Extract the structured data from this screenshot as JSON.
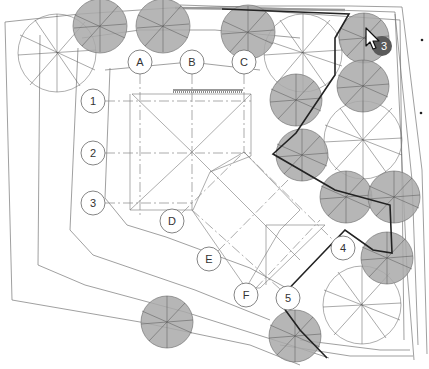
{
  "drawing": {
    "type": "site-plan",
    "grid_columns": [
      {
        "id": "col-a",
        "label": "A",
        "x": 140,
        "y": 62
      },
      {
        "id": "col-b",
        "label": "B",
        "x": 192,
        "y": 62
      },
      {
        "id": "col-c",
        "label": "C",
        "x": 244,
        "y": 62
      },
      {
        "id": "col-d",
        "label": "D",
        "x": 172,
        "y": 221
      },
      {
        "id": "col-e",
        "label": "E",
        "x": 209,
        "y": 259
      },
      {
        "id": "col-f",
        "label": "F",
        "x": 246,
        "y": 295
      }
    ],
    "grid_rows": [
      {
        "id": "row-1",
        "label": "1",
        "x": 93,
        "y": 101
      },
      {
        "id": "row-2",
        "label": "2",
        "x": 93,
        "y": 153
      },
      {
        "id": "row-3",
        "label": "3",
        "x": 93,
        "y": 203
      },
      {
        "id": "row-4",
        "label": "4",
        "x": 343,
        "y": 248
      },
      {
        "id": "row-5",
        "label": "5",
        "x": 288,
        "y": 298
      }
    ],
    "filled_trees": [
      {
        "cx": 100,
        "cy": 26,
        "r": 27
      },
      {
        "cx": 163,
        "cy": 26,
        "r": 27
      },
      {
        "cx": 248,
        "cy": 32,
        "r": 27
      },
      {
        "cx": 364,
        "cy": 38,
        "r": 25
      },
      {
        "cx": 296,
        "cy": 100,
        "r": 26
      },
      {
        "cx": 363,
        "cy": 86,
        "r": 26
      },
      {
        "cx": 302,
        "cy": 155,
        "r": 26
      },
      {
        "cx": 346,
        "cy": 197,
        "r": 26
      },
      {
        "cx": 394,
        "cy": 197,
        "r": 26
      },
      {
        "cx": 387,
        "cy": 258,
        "r": 26
      },
      {
        "cx": 295,
        "cy": 336,
        "r": 26
      },
      {
        "cx": 167,
        "cy": 322,
        "r": 26
      }
    ],
    "open_trees": [
      {
        "cx": 57,
        "cy": 53,
        "r": 39
      },
      {
        "cx": 303,
        "cy": 53,
        "r": 39
      },
      {
        "cx": 363,
        "cy": 140,
        "r": 39
      },
      {
        "cx": 362,
        "cy": 305,
        "r": 39
      }
    ],
    "cursor": {
      "x": 366,
      "y": 28,
      "badge_label": "3",
      "badge_color": "#5a5a5a"
    },
    "margin_marks": [
      {
        "x": 422,
        "y": 40
      },
      {
        "x": 421,
        "y": 113
      }
    ],
    "colors": {
      "tree_fill": "#a9a9a9",
      "line": "#777777",
      "heavy_line": "#222222",
      "background": "#ffffff"
    }
  }
}
